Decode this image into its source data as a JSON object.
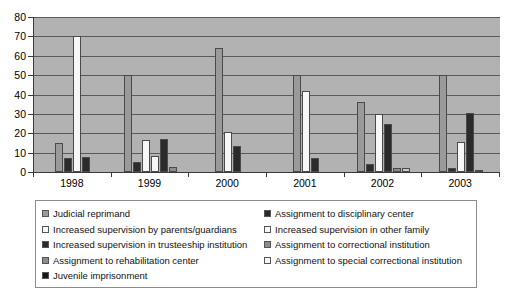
{
  "chart_data": {
    "type": "bar",
    "title": "",
    "xlabel": "",
    "ylabel": "",
    "ylim": [
      0,
      80
    ],
    "yticks": [
      0,
      10,
      20,
      30,
      40,
      50,
      60,
      70,
      80
    ],
    "grid": true,
    "legend_position": "bottom",
    "categories": [
      "1998",
      "1999",
      "2000",
      "2001",
      "2002",
      "2003"
    ],
    "series": [
      {
        "name": "Judicial reprimand",
        "color": "#9a9a9a",
        "swatch": "gray",
        "values": [
          15,
          50,
          64,
          50,
          36,
          50
        ]
      },
      {
        "name": "Assignment to disciplinary center",
        "color": "#2b2b2b",
        "swatch": "dark",
        "values": [
          7,
          5,
          0,
          0,
          4,
          2
        ]
      },
      {
        "name": "Increased supervision by parents/guardians",
        "color": "#f7f7f7",
        "swatch": "white",
        "values": [
          70,
          16.5,
          20.5,
          42,
          30,
          15.5
        ]
      },
      {
        "name": "Increased supervision in other family",
        "color": "#f7f7f7",
        "swatch": "white",
        "values": [
          0,
          8.5,
          0,
          0,
          0,
          0
        ]
      },
      {
        "name": "Increased supervision in trusteeship institution",
        "color": "#2b2b2b",
        "swatch": "dark",
        "values": [
          8,
          17,
          13.5,
          7,
          25,
          30.5
        ]
      },
      {
        "name": "Assignment to correctional institution",
        "color": "#8c8c8c",
        "swatch": "midgray",
        "values": [
          0,
          2.5,
          0,
          0,
          2,
          0
        ]
      },
      {
        "name": "Assignment to rehabilitation center",
        "color": "#8c8c8c",
        "swatch": "midgray",
        "values": [
          0,
          0,
          0,
          0,
          0,
          0
        ]
      },
      {
        "name": "Assignment to special correctional institution",
        "color": "#c9c9c9",
        "swatch": "ltgray",
        "values": [
          0,
          0,
          0,
          0,
          2,
          1
        ]
      },
      {
        "name": "Juvenile imprisonment",
        "color": "#171717",
        "swatch": "black",
        "values": [
          0,
          0,
          0,
          0,
          0,
          0
        ]
      }
    ]
  },
  "axis": {
    "y_labels": [
      "80",
      "70",
      "60",
      "50",
      "40",
      "30",
      "20",
      "10",
      "0"
    ],
    "x_labels": [
      "1998",
      "1999",
      "2000",
      "2001",
      "2002",
      "2003"
    ]
  },
  "legend": {
    "left_column": [
      {
        "label": "Judicial reprimand",
        "swatch": "gray"
      },
      {
        "label": "Increased supervision by parents/guardians",
        "swatch": "white"
      },
      {
        "label": "Increased supervision in trusteeship institution",
        "swatch": "dark"
      },
      {
        "label": "Assignment to rehabilitation center",
        "swatch": "midgray"
      },
      {
        "label": "Juvenile imprisonment",
        "swatch": "black"
      }
    ],
    "right_column": [
      {
        "label": "Assignment to disciplinary center",
        "swatch": "dark"
      },
      {
        "label": "Increased supervision in other family",
        "swatch": "white"
      },
      {
        "label": "Assignment to correctional institution",
        "swatch": "midgray"
      },
      {
        "label": "Assignment to special correctional institution",
        "swatch": "white"
      }
    ]
  },
  "colors": {
    "plot_background": "#b2b2b2",
    "gridline": "#5a5a5a",
    "axis": "#3a3a3a",
    "page_background": "#ffffff"
  }
}
